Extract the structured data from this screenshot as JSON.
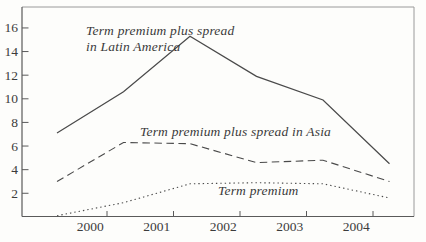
{
  "figure": {
    "background": "#fdfdfb",
    "border_color_light": "#9a9a9a",
    "axis_color": "#5a5a5a",
    "line_color": "#4a4a4a",
    "text_color": "#3a3a3a"
  },
  "chart_data": {
    "type": "line",
    "x": [
      1999,
      2000,
      2001,
      2002,
      2003,
      2004
    ],
    "x_tick_labels": [
      "2000",
      "2001",
      "2002",
      "2003",
      "2004"
    ],
    "y_ticks": [
      2,
      4,
      6,
      8,
      10,
      12,
      14,
      16
    ],
    "ylim": [
      0,
      17.8
    ],
    "grid": false,
    "legend_position": "inline-annotations",
    "series": [
      {
        "id": "latin-america",
        "name": "Term premium plus spread in Latin America",
        "style": "solid",
        "values": [
          7.1,
          10.6,
          15.3,
          11.9,
          9.9,
          4.5
        ]
      },
      {
        "id": "asia",
        "name": "Term premium plus spread in Asia",
        "style": "dashed",
        "values": [
          3.0,
          6.3,
          6.2,
          4.6,
          4.8,
          3.0
        ]
      },
      {
        "id": "term-premium",
        "name": "Term premium",
        "style": "dotted",
        "values": [
          0.1,
          1.2,
          2.8,
          2.9,
          2.8,
          1.6
        ]
      }
    ],
    "annotations": [
      {
        "id": "latin-america",
        "lines": [
          "Term premium plus spread",
          "in Latin America"
        ],
        "x": 86,
        "y": 23
      },
      {
        "id": "asia",
        "lines": [
          "Term premium plus spread in Asia"
        ],
        "x": 140,
        "y": 124
      },
      {
        "id": "term-premium",
        "lines": [
          "Term premium"
        ],
        "x": 218,
        "y": 183
      }
    ]
  }
}
